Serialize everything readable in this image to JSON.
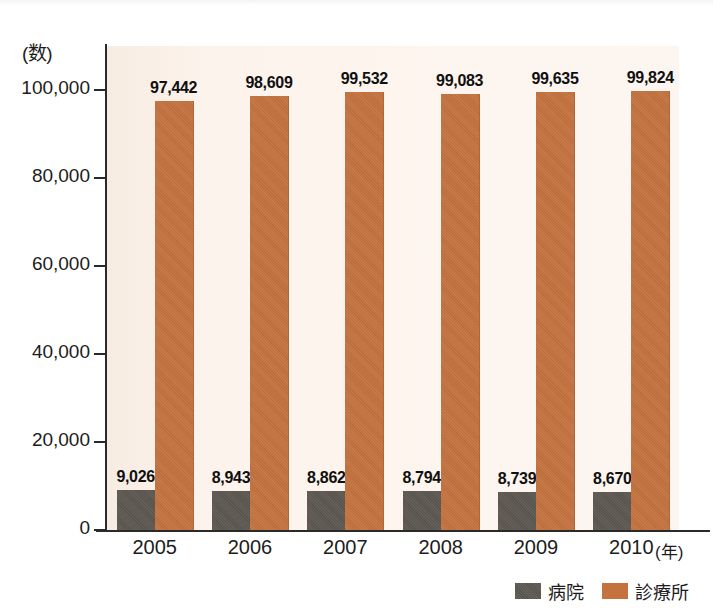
{
  "chart_data": {
    "type": "bar",
    "title": "",
    "subtitle": "",
    "xlabel": "年",
    "ylabel": "(数)",
    "categories": [
      "2005",
      "2006",
      "2007",
      "2008",
      "2009",
      "2010"
    ],
    "series": [
      {
        "name": "病院",
        "color": "#5d5852",
        "values": [
          9026,
          8943,
          8862,
          8794,
          8739,
          8670
        ],
        "labels": [
          "9,026",
          "8,943",
          "8,862",
          "8,794",
          "8,739",
          "8,670"
        ]
      },
      {
        "name": "診療所",
        "color": "#c4733f",
        "values": [
          97442,
          98609,
          99532,
          99083,
          99635,
          99824
        ],
        "labels": [
          "97,442",
          "98,609",
          "99,532",
          "99,083",
          "99,635",
          "99,824"
        ]
      }
    ],
    "ylim": [
      0,
      110000
    ],
    "yticks": [
      0,
      20000,
      40000,
      60000,
      80000,
      100000
    ],
    "ytick_labels": [
      "0",
      "20,000",
      "40,000",
      "60,000",
      "80,000",
      "100,000"
    ],
    "grid": false,
    "legend_position": "bottom-right"
  },
  "axes": {
    "y_unit_caption": "(数)",
    "x_unit_caption": "(年)"
  },
  "legend": {
    "items": [
      {
        "label": "病院",
        "color": "#5d5852"
      },
      {
        "label": "診療所",
        "color": "#c4733f"
      }
    ]
  },
  "colors": {
    "hospital": "#5d5852",
    "clinic": "#c4733f",
    "plot_background": "#fbf1e9",
    "axis": "#2a2a2a",
    "text": "#1c1c1c"
  }
}
